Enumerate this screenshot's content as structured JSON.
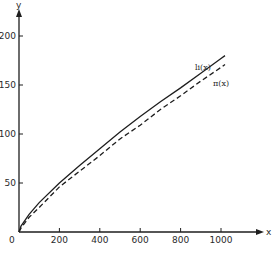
{
  "chart_data": {
    "type": "line",
    "title": "",
    "xlabel": "x",
    "ylabel": "y",
    "xlim": [
      0,
      1200
    ],
    "ylim": [
      0,
      220
    ],
    "grid": false,
    "legend_position": "inline labels at line ends",
    "x_ticks": [
      "0",
      "200",
      "400",
      "600",
      "800",
      "1000"
    ],
    "y_ticks": [
      "50",
      "100",
      "150",
      "200"
    ],
    "x": [
      0,
      10,
      50,
      100,
      200,
      300,
      400,
      500,
      600,
      700,
      800,
      900,
      1000,
      1020
    ],
    "series": [
      {
        "name": "li(x)",
        "style": "solid",
        "values": [
          0,
          6,
          18,
          30,
          50,
          68,
          85,
          102,
          118,
          133,
          147,
          162,
          177,
          180
        ]
      },
      {
        "name": "π(x)",
        "style": "dashed",
        "values": [
          0,
          4,
          15,
          25,
          46,
          62,
          78,
          95,
          109,
          125,
          139,
          154,
          168,
          171
        ]
      }
    ]
  },
  "labels": {
    "x_axis": "x",
    "y_axis": "y",
    "origin": "0",
    "series_solid": "li(x)",
    "series_dashed": "π(x)"
  },
  "colors": {
    "ink": "#1e1e1e",
    "background": "#ffffff"
  }
}
